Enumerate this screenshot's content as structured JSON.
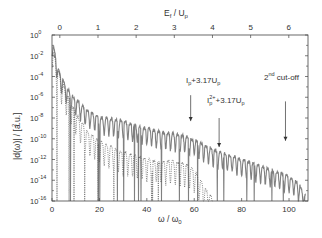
{
  "chart_data": {
    "type": "line",
    "title": "",
    "xlabel": "ω / ω0",
    "xlabel_top": "Ef / Up",
    "ylabel": "|d(ω)|² / [a.u.]",
    "xlim": [
      0,
      108
    ],
    "ylim_log10": [
      -16,
      0
    ],
    "x_ticks": [
      0,
      20,
      40,
      60,
      80,
      100
    ],
    "x_tick_labels": [
      "0",
      "20",
      "40",
      "60",
      "80",
      "100"
    ],
    "top_ticks": [
      0,
      1,
      2,
      3,
      4,
      5,
      6
    ],
    "top_tick_labels": [
      "0",
      "1",
      "2",
      "3",
      "4",
      "5",
      "6"
    ],
    "top_axis_offset_omega": 3.3,
    "top_axis_omega_per_unit": 16.1,
    "y_ticks_log10": [
      0,
      -2,
      -4,
      -6,
      -8,
      -10,
      -12,
      -14,
      -16
    ],
    "y_tick_labels": [
      "10^0",
      "10^-2",
      "10^-4",
      "10^-6",
      "10^-8",
      "10^-10",
      "10^-12",
      "10^-14",
      "10^-16"
    ],
    "grid": false,
    "legend": null,
    "series": [
      {
        "name": "full spectrum (solid)",
        "style": "solid",
        "color": "#808080",
        "envelope_x": [
          0,
          1,
          3,
          5,
          7,
          10,
          15,
          20,
          25,
          30,
          35,
          40,
          45,
          50,
          55,
          60,
          65,
          70,
          75,
          80,
          85,
          90,
          95,
          100,
          104,
          107
        ],
        "envelope_log10": [
          -0.3,
          -1.5,
          -3.5,
          -4.5,
          -5.3,
          -6.2,
          -7.3,
          -7.9,
          -8.1,
          -8.3,
          -8.7,
          -9.0,
          -9.3,
          -9.5,
          -9.7,
          -10.1,
          -10.7,
          -11.2,
          -11.6,
          -12.0,
          -12.4,
          -12.8,
          -13.2,
          -13.6,
          -14.3,
          -15.4
        ]
      },
      {
        "name": "second component (dotted)",
        "style": "dotted",
        "color": "#555555",
        "envelope_x": [
          0,
          2,
          5,
          10,
          15,
          20,
          25,
          30,
          35,
          40,
          45,
          50,
          55,
          58,
          60,
          62,
          64,
          66,
          68
        ],
        "envelope_log10": [
          -1.0,
          -3.0,
          -5.0,
          -7.5,
          -9.3,
          -10.2,
          -10.8,
          -11.3,
          -11.6,
          -11.9,
          -12.2,
          -12.1,
          -12.4,
          -12.6,
          -13.0,
          -13.8,
          -14.6,
          -15.2,
          -15.8
        ]
      }
    ],
    "annotations": [
      {
        "text": "Ip+3.17Up",
        "arrow_x": 58.5,
        "arrow_from_log10": -5.8,
        "arrow_to_log10": -8.3
      },
      {
        "text": "Ip2++3.17Up",
        "arrow_x": 70.5,
        "arrow_from_log10": -8.0,
        "arrow_to_log10": -10.8
      },
      {
        "text": "2nd cut-off",
        "arrow_x": 98.5,
        "arrow_from_log10": -6.4,
        "arrow_to_log10": -10.2
      }
    ]
  },
  "labels": {
    "xlabel_main": "ω / ω",
    "xlabel_sub": "0",
    "xlabel_top_main": "E",
    "xlabel_top_sub": "f",
    "xlabel_top_rest": " / U",
    "xlabel_top_sub2": "p",
    "ylabel": "|d(ω)|  / [a.u.]",
    "ylabel_sup": "2",
    "ann1_main": "I",
    "ann1_sub": "p",
    "ann1_rest": "+3.17U",
    "ann1_sub2": "p",
    "ann2_main": "I",
    "ann2_sub": "p",
    "ann2_sup": "2+",
    "ann2_rest": "+3.17U",
    "ann2_sub2": "p",
    "ann3_main": "2",
    "ann3_sup": "nd",
    "ann3_rest": " cut-off"
  }
}
